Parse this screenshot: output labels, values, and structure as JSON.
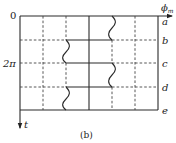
{
  "figure": {
    "caption": "(b)",
    "x_axis_label": "ϕm",
    "x_axis_label_main": "ϕ",
    "x_axis_label_sub": "m",
    "y_axis_label": "t",
    "y_ticks": [
      {
        "label": "0",
        "y": 16
      },
      {
        "label": "2π",
        "y": 63
      }
    ],
    "row_labels": [
      {
        "label": "a",
        "y": 16
      },
      {
        "label": "b",
        "y": 40
      },
      {
        "label": "c",
        "y": 63
      },
      {
        "label": "d",
        "y": 87
      },
      {
        "label": "e",
        "y": 110
      }
    ]
  }
}
